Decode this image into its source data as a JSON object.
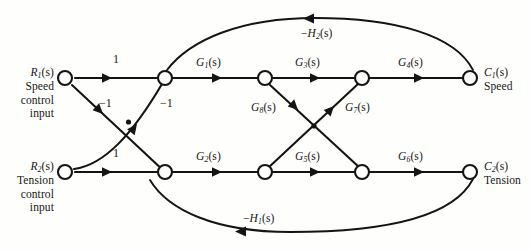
{
  "figure": {
    "type": "signal-flow-graph",
    "background": "#fefefc",
    "line_color": "#141414",
    "width": 531,
    "height": 250
  },
  "inputs": {
    "r1": {
      "symbol": "R",
      "sub": "1",
      "arg": "(s)",
      "desc_line1": "Speed",
      "desc_line2": "control",
      "desc_line3": "input"
    },
    "r2": {
      "symbol": "R",
      "sub": "2",
      "arg": "(s)",
      "desc_line1": "Tension",
      "desc_line2": "control",
      "desc_line3": "input"
    }
  },
  "outputs": {
    "c1": {
      "symbol": "C",
      "sub": "1",
      "arg": "(s)",
      "desc": "Speed"
    },
    "c2": {
      "symbol": "C",
      "sub": "2",
      "arg": "(s)",
      "desc": "Tension"
    }
  },
  "gains": {
    "unity_top": "1",
    "unity_bottom": "1",
    "neg_one_left": "−1",
    "neg_one_right": "−1",
    "g1": {
      "symbol": "G",
      "sub": "1",
      "arg": "(s)"
    },
    "g2": {
      "symbol": "G",
      "sub": "2",
      "arg": "(s)"
    },
    "g3": {
      "symbol": "G",
      "sub": "3",
      "arg": "(s)"
    },
    "g4": {
      "symbol": "G",
      "sub": "4",
      "arg": "(s)"
    },
    "g5": {
      "symbol": "G",
      "sub": "5",
      "arg": "(s)"
    },
    "g6": {
      "symbol": "G",
      "sub": "6",
      "arg": "(s)"
    },
    "g7": {
      "symbol": "G",
      "sub": "7",
      "arg": "(s)"
    },
    "g8": {
      "symbol": "G",
      "sub": "8",
      "arg": "(s)"
    },
    "h1": {
      "sign": "−",
      "symbol": "H",
      "sub": "1",
      "arg": "(s)"
    },
    "h2": {
      "sign": "−",
      "symbol": "H",
      "sub": "2",
      "arg": "(s)"
    }
  },
  "nodes": [
    {
      "id": "R1",
      "x": 65,
      "y": 78,
      "label": "R1(s)"
    },
    {
      "id": "N1",
      "x": 165,
      "y": 78,
      "label": "summing-node-speed"
    },
    {
      "id": "N2",
      "x": 265,
      "y": 78,
      "label": "node-g1-out"
    },
    {
      "id": "N3",
      "x": 362,
      "y": 78,
      "label": "node-g3-out"
    },
    {
      "id": "C1",
      "x": 470,
      "y": 78,
      "label": "C1(s)"
    },
    {
      "id": "R2",
      "x": 65,
      "y": 172,
      "label": "R2(s)"
    },
    {
      "id": "N4",
      "x": 165,
      "y": 172,
      "label": "summing-node-tension"
    },
    {
      "id": "N5",
      "x": 265,
      "y": 172,
      "label": "node-g2-out"
    },
    {
      "id": "N6",
      "x": 362,
      "y": 172,
      "label": "node-g5-out"
    },
    {
      "id": "C2",
      "x": 470,
      "y": 172,
      "label": "C2(s)"
    }
  ],
  "branches": [
    {
      "from": "R1",
      "to": "N1",
      "gain": "1"
    },
    {
      "from": "R1",
      "to": "N4",
      "gain": "−1"
    },
    {
      "from": "R2",
      "to": "N1",
      "gain": "−1"
    },
    {
      "from": "R2",
      "to": "N4",
      "gain": "1"
    },
    {
      "from": "N1",
      "to": "N2",
      "gain": "G1(s)"
    },
    {
      "from": "N2",
      "to": "N3",
      "gain": "G3(s)"
    },
    {
      "from": "N3",
      "to": "C1",
      "gain": "G4(s)"
    },
    {
      "from": "N4",
      "to": "N5",
      "gain": "G2(s)"
    },
    {
      "from": "N5",
      "to": "N6",
      "gain": "G5(s)"
    },
    {
      "from": "N6",
      "to": "C2",
      "gain": "G6(s)"
    },
    {
      "from": "N2",
      "to": "N6",
      "gain": "G8(s)"
    },
    {
      "from": "N5",
      "to": "N3",
      "gain": "G7(s)"
    },
    {
      "from": "C1",
      "to": "N1",
      "gain": "−H2(s)"
    },
    {
      "from": "C2",
      "to": "N4",
      "gain": "−H1(s)"
    }
  ]
}
